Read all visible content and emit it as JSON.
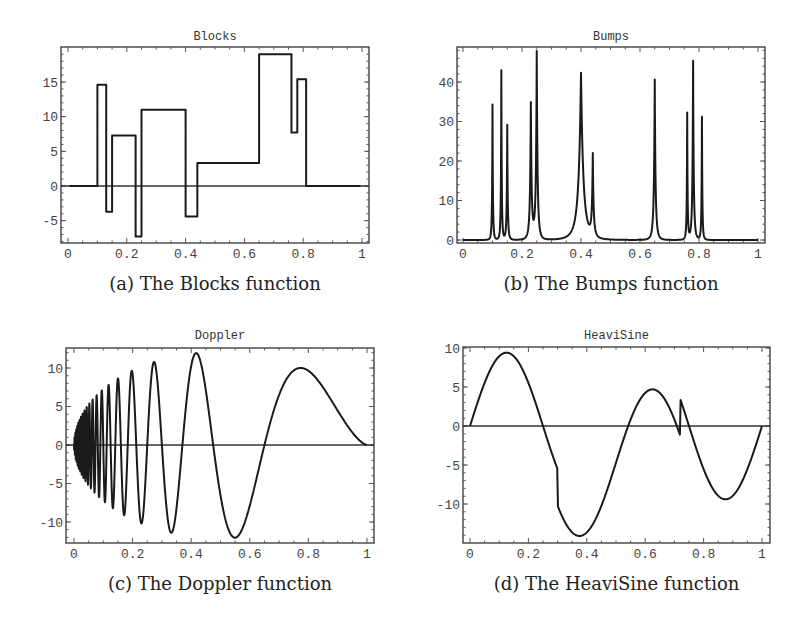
{
  "chart_data": [
    {
      "id": "a",
      "type": "line",
      "title": "Blocks",
      "caption": "(a) The Blocks function",
      "xlabel": "",
      "ylabel": "",
      "xlim": [
        0,
        1
      ],
      "ylim": [
        -8,
        19.5
      ],
      "xticks": [
        0,
        0.2,
        0.4,
        0.6,
        0.8,
        1
      ],
      "xtick_labels": [
        "0",
        "0.2",
        "0.4",
        "0.6",
        "0.8",
        "1"
      ],
      "yticks": [
        -5,
        0,
        5,
        10,
        15
      ],
      "ytick_labels": [
        "-5",
        "0",
        "5",
        "10",
        "15"
      ],
      "zero_line": true,
      "steps": {
        "breakpoints": [
          0.1,
          0.13,
          0.15,
          0.23,
          0.25,
          0.4,
          0.44,
          0.65,
          0.76,
          0.78,
          0.81
        ],
        "levels": [
          0,
          14.6,
          -3.7,
          7.3,
          -7.3,
          11.0,
          -4.4,
          3.3,
          19.0,
          7.7,
          15.4,
          0
        ]
      }
    },
    {
      "id": "b",
      "type": "line",
      "title": "Bumps",
      "caption": "(b) The Bumps function",
      "xlabel": "",
      "ylabel": "",
      "xlim": [
        0,
        1
      ],
      "ylim": [
        -1,
        49
      ],
      "xticks": [
        0,
        0.2,
        0.4,
        0.6,
        0.8,
        1
      ],
      "xtick_labels": [
        "0",
        "0.2",
        "0.4",
        "0.6",
        "0.8",
        "1"
      ],
      "yticks": [
        0,
        10,
        20,
        30,
        40
      ],
      "ytick_labels": [
        "0",
        "10",
        "20",
        "30",
        "40"
      ],
      "zero_line": false,
      "peaks": {
        "positions": [
          0.1,
          0.13,
          0.15,
          0.23,
          0.25,
          0.4,
          0.44,
          0.65,
          0.76,
          0.78,
          0.81
        ],
        "heights": [
          34.3,
          42.9,
          29.1,
          34.3,
          47.4,
          42.3,
          20.6,
          40.6,
          32.0,
          45.3,
          31.1
        ],
        "widths": [
          0.005,
          0.005,
          0.006,
          0.01,
          0.01,
          0.03,
          0.01,
          0.01,
          0.005,
          0.008,
          0.005
        ]
      }
    },
    {
      "id": "c",
      "type": "line",
      "title": "Doppler",
      "caption": "(c) The Doppler function",
      "xlabel": "",
      "ylabel": "",
      "xlim": [
        0,
        1
      ],
      "ylim": [
        -12.5,
        12.5
      ],
      "xticks": [
        0,
        0.2,
        0.4,
        0.6,
        0.8,
        1
      ],
      "xtick_labels": [
        "0",
        "0.2",
        "0.4",
        "0.6",
        "0.8",
        "1"
      ],
      "yticks": [
        -10,
        -5,
        0,
        5,
        10
      ],
      "ytick_labels": [
        "-10",
        "-5",
        "0",
        "5",
        "10"
      ],
      "zero_line": true,
      "formula": {
        "amplitude": 24.2,
        "freq": 2.1,
        "shift": 0.05
      },
      "extrema": [
        {
          "x": 0.42,
          "y": 11.9
        },
        {
          "x": 0.55,
          "y": -12.0
        },
        {
          "x": 0.77,
          "y": 10.0
        },
        {
          "x": 0.27,
          "y": 10.8
        },
        {
          "x": 0.33,
          "y": -11.3
        },
        {
          "x": 0.2,
          "y": 9.7
        }
      ]
    },
    {
      "id": "d",
      "type": "line",
      "title": "HeaviSine",
      "caption": "(d) The HeaviSine function",
      "xlabel": "",
      "ylabel": "",
      "xlim": [
        0,
        1
      ],
      "ylim": [
        -14.5,
        10
      ],
      "xticks": [
        0,
        0.2,
        0.4,
        0.6,
        0.8,
        1
      ],
      "xtick_labels": [
        "0",
        "0.2",
        "0.4",
        "0.6",
        "0.8",
        "1"
      ],
      "yticks": [
        -10,
        -5,
        0,
        5,
        10
      ],
      "ytick_labels": [
        "-10",
        "-5",
        "0",
        "5",
        "10"
      ],
      "zero_line": true,
      "formula": {
        "scale": 2.35,
        "sine_amp": 4,
        "jump1": 0.3,
        "jump2": 0.72
      },
      "extrema": [
        {
          "x": 0.125,
          "y": 9.4
        },
        {
          "x": 0.375,
          "y": -14.1
        },
        {
          "x": 0.625,
          "y": 4.7
        },
        {
          "x": 0.875,
          "y": -9.4
        }
      ]
    }
  ]
}
